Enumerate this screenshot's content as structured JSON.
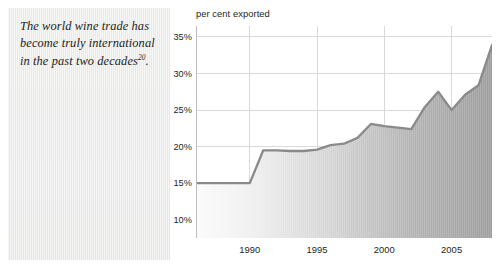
{
  "quote": {
    "text_before": "The world wine trade has become truly international in the past two decades",
    "footnote_marker": "20",
    "text_after": "."
  },
  "colors": {
    "panel_background": "#ecebea",
    "plot_background": "#ffffff",
    "gridline": "#d9d9d9",
    "axis_line": "#bdbdbd",
    "series_line": "#8a8a8a",
    "area_fill_light": "#f3f3f3",
    "area_fill_dark": "#9a9a9a",
    "text": "#231f20"
  },
  "chart_data": {
    "type": "area",
    "title": "per cent exported",
    "xlabel": "",
    "ylabel": "per cent exported",
    "grid": true,
    "legend": "none",
    "xlim": [
      1986,
      2008
    ],
    "ylim": [
      7.5,
      36.5
    ],
    "ytick_labels": [
      "35%",
      "30%",
      "25%",
      "20%",
      "15%",
      "10%"
    ],
    "ytick_values": [
      35,
      30,
      25,
      20,
      15,
      10
    ],
    "xtick_labels": [
      "1990",
      "1995",
      "2000",
      "2005"
    ],
    "xtick_values": [
      1990,
      1995,
      2000,
      2005
    ],
    "series": [
      {
        "name": "per cent exported",
        "x": [
          1986,
          1987,
          1988,
          1989,
          1990,
          1991,
          1992,
          1993,
          1994,
          1995,
          1996,
          1997,
          1998,
          1999,
          2000,
          2001,
          2002,
          2003,
          2004,
          2005,
          2006,
          2007,
          2008
        ],
        "values": [
          15.0,
          15.0,
          15.0,
          15.0,
          15.0,
          19.5,
          19.5,
          19.4,
          19.4,
          19.6,
          20.2,
          20.4,
          21.2,
          23.1,
          22.8,
          22.6,
          22.4,
          25.4,
          27.5,
          25.0,
          27.1,
          28.4,
          33.9
        ]
      }
    ]
  }
}
